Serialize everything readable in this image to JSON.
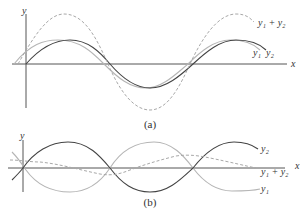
{
  "figure": {
    "panel_a": {
      "caption": "(a)",
      "axis_x_label": "x",
      "axis_y_label": "y",
      "curve_labels": {
        "sum": "y₁ + y₂",
        "y1": "y₁",
        "y2": "y₂"
      },
      "description": "Two waves y1 and y2 nearly in phase; their sum y1 + y2 (dashed) has roughly double amplitude (constructive interference)."
    },
    "panel_b": {
      "caption": "(b)",
      "axis_x_label": "x",
      "axis_y_label": "y",
      "curve_labels": {
        "y2": "y₂",
        "sum": "y₁ + y₂",
        "y1": "y₁"
      },
      "description": "Two waves y1 and y2 nearly out of phase; their sum y1 + y2 (dashed) has small amplitude (destructive interference)."
    },
    "colors": {
      "axis": "#555555",
      "dark_curve": "#444444",
      "light_curve": "#b5b5b5",
      "dashed_curve": "#a8a8a8",
      "text": "#333333"
    }
  }
}
